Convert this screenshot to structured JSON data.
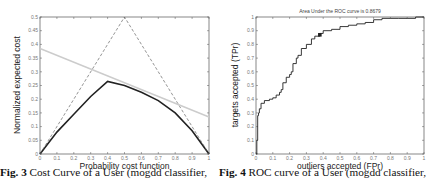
{
  "chart_data": [
    {
      "type": "line",
      "title": "",
      "xlabel": "Probability cost function",
      "ylabel": "Normalized expected cost",
      "xlim": [
        0,
        1
      ],
      "ylim": [
        0,
        0.5
      ],
      "xticks": [
        "0",
        "0.1",
        "0.2",
        "0.3",
        "0.4",
        "0.5",
        "0.6",
        "0.7",
        "0.8",
        "0.9",
        "1"
      ],
      "yticks": [
        "0",
        "0.05",
        "0.1",
        "0.15",
        "0.2",
        "0.25",
        "0.3",
        "0.35",
        "0.4",
        "0.45",
        "0.5"
      ],
      "grid": false,
      "series": [
        {
          "name": "cost curve (lower envelope)",
          "style": "solid-thick",
          "color": "#222222",
          "x": [
            0,
            0.1,
            0.2,
            0.3,
            0.4,
            0.5,
            0.6,
            0.7,
            0.8,
            0.9,
            1.0
          ],
          "y": [
            0,
            0.08,
            0.145,
            0.21,
            0.265,
            0.25,
            0.225,
            0.195,
            0.15,
            0.085,
            0
          ]
        },
        {
          "name": "trivial classifiers",
          "style": "dashed",
          "color": "#666666",
          "x": [
            0,
            0.5,
            1.0
          ],
          "y": [
            0,
            0.5,
            0
          ]
        },
        {
          "name": "operating point line",
          "style": "solid-light",
          "color": "#cccccc",
          "x": [
            0,
            1.0
          ],
          "y": [
            0.385,
            0.135
          ]
        }
      ],
      "caption": {
        "label": "Fig. 3",
        "text": " Cost Curve of a User (mogdd classifier,"
      }
    },
    {
      "type": "line",
      "title": "Area Under the ROC curve is 0.8679",
      "xlabel": "outliers accepted (FPr)",
      "ylabel": "targets accepted (TPr)",
      "xlim": [
        0,
        1
      ],
      "ylim": [
        0,
        1
      ],
      "xticks": [
        "0",
        "0.1",
        "0.2",
        "0.3",
        "0.4",
        "0.5",
        "0.6",
        "0.7",
        "0.8",
        "0.9",
        "1"
      ],
      "yticks": [
        "0",
        "0.1",
        "0.2",
        "0.3",
        "0.4",
        "0.5",
        "0.6",
        "0.7",
        "0.8",
        "0.9",
        "1"
      ],
      "grid": false,
      "series": [
        {
          "name": "ROC",
          "style": "step",
          "color": "#222222",
          "x": [
            0,
            0.005,
            0.01,
            0.015,
            0.02,
            0.03,
            0.05,
            0.08,
            0.1,
            0.12,
            0.14,
            0.15,
            0.16,
            0.18,
            0.2,
            0.21,
            0.22,
            0.24,
            0.25,
            0.27,
            0.3,
            0.33,
            0.35,
            0.38,
            0.4,
            0.45,
            0.5,
            0.55,
            0.6,
            0.65,
            0.7,
            0.75,
            0.8,
            0.85,
            0.9,
            0.95,
            1.0
          ],
          "y": [
            0,
            0.1,
            0.28,
            0.3,
            0.33,
            0.37,
            0.39,
            0.4,
            0.41,
            0.43,
            0.45,
            0.47,
            0.52,
            0.56,
            0.58,
            0.6,
            0.66,
            0.7,
            0.72,
            0.77,
            0.8,
            0.84,
            0.86,
            0.88,
            0.9,
            0.91,
            0.93,
            0.94,
            0.95,
            0.96,
            0.98,
            0.99,
            0.99,
            0.99,
            0.99,
            1.0,
            1.0
          ]
        },
        {
          "name": "operating point",
          "style": "marker",
          "color": "#222222",
          "x": [
            0.38
          ],
          "y": [
            0.87
          ]
        }
      ],
      "caption": {
        "label": "Fig. 4",
        "text": " ROC curve of a User (mogdd classifier,"
      }
    }
  ]
}
